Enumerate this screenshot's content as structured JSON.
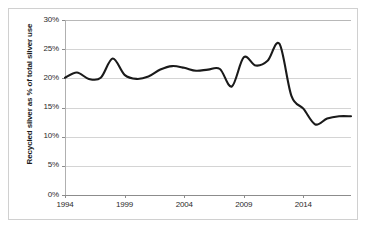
{
  "chart_data": {
    "type": "line",
    "title": "",
    "xlabel": "",
    "ylabel": "Recycled silver as % of total silver use",
    "xlim": [
      1994,
      2018
    ],
    "ylim": [
      0,
      30
    ],
    "grid": true,
    "legend": false,
    "y_ticks": [
      "0%",
      "5%",
      "10%",
      "15%",
      "20%",
      "25%",
      "30%"
    ],
    "y_tick_values": [
      0,
      5,
      10,
      15,
      20,
      25,
      30
    ],
    "x_ticks": [
      "1994",
      "1999",
      "2004",
      "2009",
      "2014"
    ],
    "x_tick_values": [
      1994,
      1999,
      2004,
      2009,
      2014
    ],
    "series": [
      {
        "name": "Recycled silver share",
        "color": "#1a1a1a",
        "x": [
          1994,
          1995,
          1996,
          1997,
          1998,
          1999,
          2000,
          2001,
          2002,
          2003,
          2004,
          2005,
          2006,
          2007,
          2008,
          2009,
          2010,
          2011,
          2012,
          2013,
          2014,
          2015,
          2016,
          2017,
          2018
        ],
        "values": [
          20.1,
          21.0,
          19.9,
          20.1,
          23.4,
          20.6,
          19.9,
          20.3,
          21.5,
          22.1,
          21.8,
          21.3,
          21.5,
          21.6,
          18.6,
          23.6,
          22.2,
          23.0,
          25.9,
          17.0,
          14.8,
          12.1,
          13.1,
          13.5,
          13.5
        ]
      }
    ]
  }
}
